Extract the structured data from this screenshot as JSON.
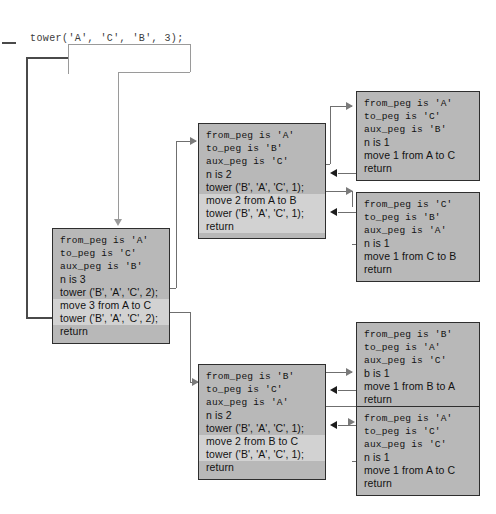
{
  "diagram": {
    "title_call": "tower('A', 'C', 'B', 3);",
    "frames": {
      "root": {
        "name": "frame-n3",
        "lines": [
          {
            "text": "from_peg is 'A'",
            "mono": true,
            "hl": false
          },
          {
            "text": "to_peg is 'C'",
            "mono": true,
            "hl": false
          },
          {
            "text": "aux_peg is 'B'",
            "mono": true,
            "hl": false
          },
          {
            "text": "n is 3",
            "mono": false,
            "hl": false
          },
          {
            "text": "tower ('B', 'A', 'C', 2);",
            "mono": false,
            "hl": false
          },
          {
            "text": "move 3 from A to C",
            "mono": false,
            "hl": true
          },
          {
            "text": "tower ('B', 'A', 'C', 2);",
            "mono": false,
            "hl": true
          },
          {
            "text": "return",
            "mono": false,
            "hl": false
          }
        ]
      },
      "mid_top": {
        "name": "frame-n2-atob",
        "lines": [
          {
            "text": "from_peg is 'A'",
            "mono": true,
            "hl": false
          },
          {
            "text": "to_peg is 'B'",
            "mono": true,
            "hl": false
          },
          {
            "text": "aux_peg is 'C'",
            "mono": true,
            "hl": false
          },
          {
            "text": "n is 2",
            "mono": false,
            "hl": false
          },
          {
            "text": "tower ('B', 'A', 'C', 1);",
            "mono": false,
            "hl": false
          },
          {
            "text": "move 2 from A to B",
            "mono": false,
            "hl": true
          },
          {
            "text": "tower ('B', 'A', 'C', 1);",
            "mono": false,
            "hl": true
          },
          {
            "text": "return",
            "mono": false,
            "hl": true
          }
        ]
      },
      "mid_bottom": {
        "name": "frame-n2-btoc",
        "lines": [
          {
            "text": "from_peg is 'B'",
            "mono": true,
            "hl": false
          },
          {
            "text": "to_peg is 'C'",
            "mono": true,
            "hl": false
          },
          {
            "text": "aux_peg is 'A'",
            "mono": true,
            "hl": false
          },
          {
            "text": "n is 2",
            "mono": false,
            "hl": false
          },
          {
            "text": "tower ('B', 'A', 'C', 1);",
            "mono": false,
            "hl": false
          },
          {
            "text": "move 2 from B to C",
            "mono": false,
            "hl": true
          },
          {
            "text": "tower ('B', 'A', 'C', 1);",
            "mono": false,
            "hl": true
          },
          {
            "text": "return",
            "mono": false,
            "hl": false
          }
        ]
      },
      "leaf1": {
        "name": "frame-n1-atoc-top",
        "lines": [
          {
            "text": "from_peg is 'A'",
            "mono": true,
            "hl": false
          },
          {
            "text": "to_peg is 'C'",
            "mono": true,
            "hl": false
          },
          {
            "text": "aux_peg is 'B'",
            "mono": true,
            "hl": false
          },
          {
            "text": "n is 1",
            "mono": false,
            "hl": false
          },
          {
            "text": "move 1 from A to C",
            "mono": false,
            "hl": false
          },
          {
            "text": "return",
            "mono": false,
            "hl": false
          }
        ]
      },
      "leaf2": {
        "name": "frame-n1-ctob",
        "lines": [
          {
            "text": "from_peg is 'C'",
            "mono": true,
            "hl": false
          },
          {
            "text": "to_peg is 'B'",
            "mono": true,
            "hl": false
          },
          {
            "text": "aux_peg is 'A'",
            "mono": true,
            "hl": false
          },
          {
            "text": "n is 1",
            "mono": false,
            "hl": false
          },
          {
            "text": "move 1 from C to B",
            "mono": false,
            "hl": false
          },
          {
            "text": "return",
            "mono": false,
            "hl": false
          }
        ]
      },
      "leaf3": {
        "name": "frame-n1-btoa",
        "lines": [
          {
            "text": "from_peg is 'B'",
            "mono": true,
            "hl": false
          },
          {
            "text": "to_peg is 'A'",
            "mono": true,
            "hl": false
          },
          {
            "text": "aux_peg is 'C'",
            "mono": true,
            "hl": false
          },
          {
            "text": "b is 1",
            "mono": false,
            "hl": false
          },
          {
            "text": "move 1 from B to A",
            "mono": false,
            "hl": false
          },
          {
            "text": "return",
            "mono": false,
            "hl": false
          }
        ]
      },
      "leaf4": {
        "name": "frame-n1-atoc-bottom",
        "lines": [
          {
            "text": "from_peg is 'A'",
            "mono": true,
            "hl": false
          },
          {
            "text": "to_peg is 'C'",
            "mono": true,
            "hl": false
          },
          {
            "text": "aux_peg is 'C'",
            "mono": true,
            "hl": false
          },
          {
            "text": "n is 1",
            "mono": false,
            "hl": false
          },
          {
            "text": "move 1 from A to C",
            "mono": false,
            "hl": false
          },
          {
            "text": "return",
            "mono": false,
            "hl": false
          }
        ]
      }
    },
    "colors": {
      "frame_fill": "#b8b8b8",
      "frame_border": "#2e2e2e",
      "highlight_row": "#d2d2d2",
      "connector": "#6f6f6f",
      "arrow_return": "#1d1d1d",
      "background": "#ffffff"
    }
  }
}
